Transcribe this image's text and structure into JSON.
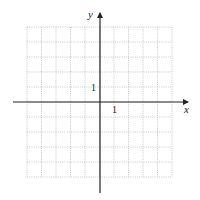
{
  "chart_data": {
    "type": "scatter",
    "title": "",
    "xlabel": "x",
    "ylabel": "y",
    "xlim": [
      -5,
      5
    ],
    "ylim": [
      -5,
      5
    ],
    "grid": true,
    "grid_style": "dotted",
    "tick_labels": {
      "x": "1",
      "y": "1"
    },
    "series": []
  },
  "axes": {
    "x_label": "x",
    "y_label": "y",
    "x_unit_label": "1",
    "y_unit_label": "1"
  },
  "colors": {
    "axis": "#222222",
    "grid": "#b8b8b8",
    "background": "#ffffff"
  }
}
